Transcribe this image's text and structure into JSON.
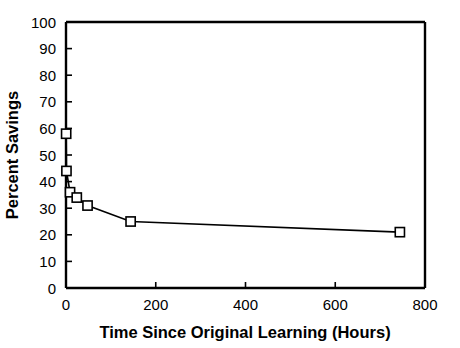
{
  "chart_data": {
    "type": "line",
    "title": "",
    "xlabel": "Time Since Original Learning (Hours)",
    "ylabel": "Percent Savings",
    "xlim": [
      0,
      800
    ],
    "ylim": [
      0,
      100
    ],
    "xticks": [
      0,
      200,
      400,
      600,
      800
    ],
    "yticks": [
      0,
      10,
      20,
      30,
      40,
      50,
      60,
      70,
      80,
      90,
      100
    ],
    "xtick_labels": [
      "0",
      "200",
      "400",
      "600",
      "800"
    ],
    "ytick_labels": [
      "0",
      "10",
      "20",
      "30",
      "40",
      "50",
      "60",
      "70",
      "80",
      "90",
      "100"
    ],
    "grid": false,
    "legend": null,
    "marker": "open-square",
    "line_color": "#000000",
    "marker_fill": "#ffffff",
    "marker_edge": "#000000",
    "series": [
      {
        "name": "Percent Savings",
        "x": [
          0.33,
          1,
          9,
          24,
          48,
          144,
          744
        ],
        "y": [
          58,
          44,
          36,
          34,
          31,
          25,
          21
        ]
      }
    ]
  },
  "axes": {
    "x_title": "Time Since Original Learning (Hours)",
    "y_title": "Percent Savings"
  }
}
